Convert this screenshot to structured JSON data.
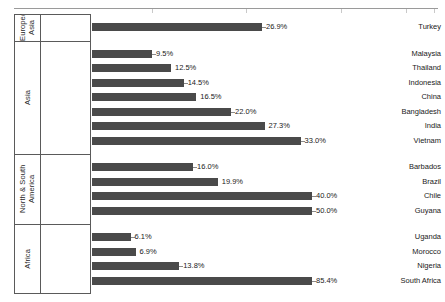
{
  "chart_data": {
    "type": "bar",
    "orientation": "horizontal",
    "title": "",
    "xlabel": "",
    "ylabel": "",
    "value_suffix": "%",
    "xlim": [
      0,
      56
    ],
    "grid": false,
    "legend": false,
    "bar_color": "#4a4a4a",
    "groups": [
      {
        "name": "Europe/ Asia",
        "categories": [
          "Turkey"
        ],
        "values": [
          26.9
        ],
        "labels": [
          "26.9%"
        ]
      },
      {
        "name": "Asia",
        "categories": [
          "Malaysia",
          "Thailand",
          "Indonesia",
          "China",
          "Bangladesh",
          "India",
          "Vietnam"
        ],
        "values": [
          9.5,
          12.5,
          14.5,
          16.5,
          22.0,
          27.3,
          33.0
        ],
        "labels": [
          "9.5%",
          "12.5%",
          "14.5%",
          "16.5%",
          "22.0%",
          "27.3%",
          "33.0%"
        ]
      },
      {
        "name": "North & South America",
        "categories": [
          "Barbados",
          "Brazil",
          "Chile",
          "Guyana"
        ],
        "values": [
          16.0,
          19.9,
          40.0,
          50.0
        ],
        "labels": [
          "16.0%",
          "19.9%",
          "40.0%",
          "50.0%"
        ]
      },
      {
        "name": "Africa",
        "categories": [
          "Uganda",
          "Morocco",
          "Nigeria",
          "South Africa"
        ],
        "values": [
          6.1,
          6.9,
          13.8,
          85.4
        ],
        "labels": [
          "6.1%",
          "6.9%",
          "13.8%",
          "85.4%"
        ]
      }
    ]
  }
}
